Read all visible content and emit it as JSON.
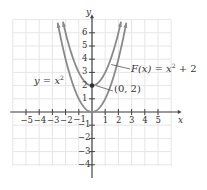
{
  "chart_data": {
    "type": "line",
    "title": "",
    "xlabel": "x",
    "ylabel": "y",
    "xlim": [
      -6,
      6
    ],
    "ylim": [
      -5,
      7
    ],
    "grid": true,
    "x_ticks": [
      "−5",
      "−4",
      "−3",
      "−2",
      "−1",
      "1",
      "2",
      "3",
      "4",
      "5"
    ],
    "y_ticks": [
      "6",
      "5",
      "4",
      "3",
      "2",
      "1",
      "−1",
      "−2",
      "−3",
      "−4"
    ],
    "series": [
      {
        "name": "y = x²",
        "expression": "x^2",
        "color": "#8a8a8a",
        "x": [
          -2.6,
          -2,
          -1,
          0,
          1,
          2,
          2.6
        ],
        "values": [
          6.76,
          4,
          1,
          0,
          1,
          4,
          6.76
        ]
      },
      {
        "name": "F(x) = x² + 2",
        "expression": "x^2 + 2",
        "color": "#8a8a8a",
        "x": [
          -2.2,
          -2,
          -1,
          0,
          1,
          2,
          2.2
        ],
        "values": [
          6.84,
          6,
          3,
          2,
          3,
          6,
          6.84
        ]
      }
    ],
    "annotations": [
      {
        "text": "y = x²",
        "target": "y = x² curve"
      },
      {
        "text": "F(x) = x² + 2",
        "target": "F(x) curve"
      },
      {
        "text": "(0, 2)",
        "point": [
          0,
          2
        ]
      }
    ]
  },
  "labels": {
    "x_axis": "x",
    "y_axis": "y",
    "y_eq_prefix": "y = x",
    "y_eq_exp": "2",
    "f_prefix": "F(x) = x",
    "f_exp": "2",
    "f_suffix": " + 2",
    "point": "(0, 2)"
  }
}
